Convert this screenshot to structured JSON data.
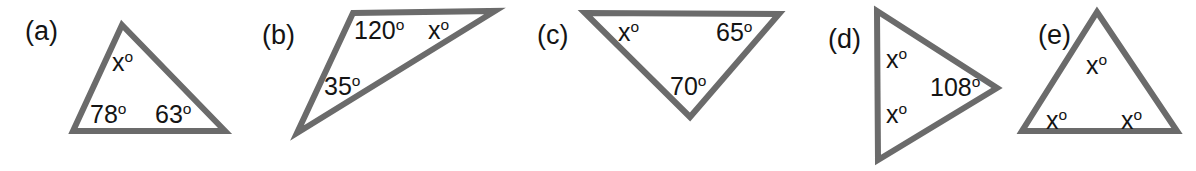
{
  "figure": {
    "width": 1196,
    "height": 171,
    "background": "#ffffff",
    "stroke_color": "#6b6b6b",
    "text_color": "#141414",
    "stroke_width": 6
  },
  "panels": [
    {
      "id": "a",
      "label": "(a)",
      "label_pos": {
        "x": 25,
        "y": 18
      },
      "shape": "triangle",
      "points": "122,25 225,131 73,131",
      "angles": [
        {
          "name": "apex",
          "text": "x",
          "degree": true,
          "x": 112,
          "y": 50
        },
        {
          "name": "bottom-left",
          "text": "78",
          "degree": true,
          "x": 90,
          "y": 102
        },
        {
          "name": "bottom-right",
          "text": "63",
          "degree": true,
          "x": 155,
          "y": 102
        }
      ]
    },
    {
      "id": "b",
      "label": "(b)",
      "label_pos": {
        "x": 262,
        "y": 22
      },
      "shape": "triangle",
      "points": "353,13 495,11 297,133",
      "angles": [
        {
          "name": "top-left",
          "text": "120",
          "degree": true,
          "x": 354,
          "y": 18
        },
        {
          "name": "top-right",
          "text": "x",
          "degree": true,
          "x": 428,
          "y": 18
        },
        {
          "name": "bottom-left",
          "text": "35",
          "degree": true,
          "x": 324,
          "y": 74
        }
      ]
    },
    {
      "id": "c",
      "label": "(c)",
      "label_pos": {
        "x": 537,
        "y": 22
      },
      "shape": "triangle",
      "points": "585,13 779,14 690,117",
      "angles": [
        {
          "name": "top-left",
          "text": "x",
          "degree": true,
          "x": 618,
          "y": 20
        },
        {
          "name": "top-right",
          "text": "65",
          "degree": true,
          "x": 716,
          "y": 20
        },
        {
          "name": "bottom",
          "text": "70",
          "degree": true,
          "x": 670,
          "y": 74
        }
      ]
    },
    {
      "id": "d",
      "label": "(d)",
      "label_pos": {
        "x": 828,
        "y": 26
      },
      "shape": "triangle",
      "points": "877,11 997,88 878,160",
      "angles": [
        {
          "name": "top-left",
          "text": "x",
          "degree": true,
          "x": 886,
          "y": 47
        },
        {
          "name": "bottom-left",
          "text": "x",
          "degree": true,
          "x": 886,
          "y": 102
        },
        {
          "name": "right",
          "text": "108",
          "degree": true,
          "x": 930,
          "y": 75
        }
      ]
    },
    {
      "id": "e",
      "label": "(e)",
      "label_pos": {
        "x": 1038,
        "y": 22
      },
      "shape": "triangle",
      "points": "1097,12 1177,131 1022,131",
      "angles": [
        {
          "name": "apex",
          "text": "x",
          "degree": true,
          "x": 1086,
          "y": 53
        },
        {
          "name": "bottom-left",
          "text": "x",
          "degree": true,
          "x": 1046,
          "y": 108
        },
        {
          "name": "bottom-right",
          "text": "x",
          "degree": true,
          "x": 1121,
          "y": 108
        }
      ]
    }
  ]
}
